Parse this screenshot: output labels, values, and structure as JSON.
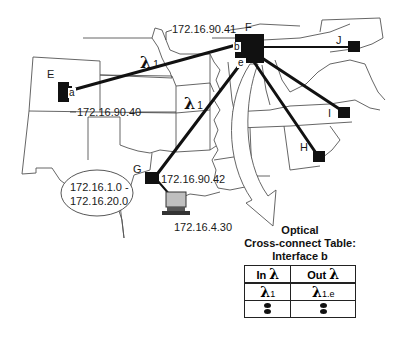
{
  "nodes": {
    "E": {
      "label": "E",
      "interface": "a"
    },
    "F": {
      "label": "F",
      "interfaces": [
        "b",
        "e"
      ]
    },
    "G": {
      "label": "G"
    },
    "H": {
      "label": "H"
    },
    "I": {
      "label": "I"
    },
    "J": {
      "label": "J"
    }
  },
  "addresses": {
    "f_b": "172.16.90.41",
    "e_a": "172.16.90.40",
    "g": "172.16.90.42",
    "host": "172.16.4.30",
    "range_line1": "172.16.1.0 -",
    "range_line2": "172.16.20.0"
  },
  "wavelengths": {
    "link_e_f": {
      "symbol": "λ",
      "index": "1"
    },
    "link_g_f": {
      "symbol": "λ",
      "index": "1"
    }
  },
  "cross_connect": {
    "title_line1": "Optical",
    "title_line2": "Cross-connect Table:",
    "title_line3": "Interface b",
    "headers": [
      {
        "text": "In",
        "symbol": "λ"
      },
      {
        "text": "Out",
        "symbol": "λ"
      }
    ],
    "rows": [
      {
        "in_symbol": "λ",
        "in_index": "1",
        "out_symbol": "λ",
        "out_index": "1.e"
      },
      {
        "in_symbol": "⋮",
        "in_index": "",
        "out_symbol": "⋮",
        "out_index": ""
      }
    ]
  },
  "colors": {
    "node": "#111111",
    "link": "#111111",
    "map_border": "#555555",
    "computer_screen": "#bfbfbf"
  }
}
